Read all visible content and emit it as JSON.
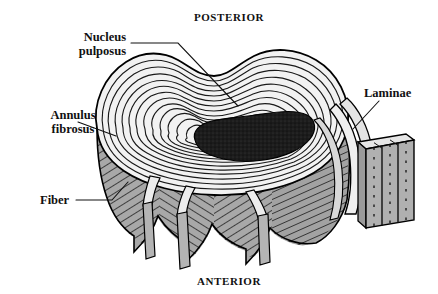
{
  "figure": {
    "background_color": "#ffffff",
    "orientation_labels": {
      "top": "POSTERIOR",
      "bottom": "ANTERIOR"
    },
    "labels": [
      {
        "id": "nucleus-pulposus",
        "lines": [
          "Nucleus",
          "pulposus"
        ],
        "line1": "Nucleus",
        "line2": "pulposus",
        "align": "center",
        "x": 72,
        "y": 32
      },
      {
        "id": "annulus-fibrosus",
        "lines": [
          "Annulus",
          "fibrosus"
        ],
        "line1": "Annulus",
        "line2": "fibrosus",
        "align": "center",
        "x": 14,
        "y": 110
      },
      {
        "id": "fiber",
        "lines": [
          "Fiber"
        ],
        "line1": "Fiber",
        "align": "left",
        "x": 40,
        "y": 199
      },
      {
        "id": "laminae",
        "lines": [
          "Laminae"
        ],
        "line1": "Laminae",
        "align": "left",
        "x": 363,
        "y": 94
      }
    ],
    "colors": {
      "ink": "#111111",
      "outline": "#000000",
      "nucleus_fill": "#1c1c1c",
      "annulus_gray": "#a8a8a8",
      "lamella_light": "#f2f2f2",
      "strip_gray": "#b4b4b4",
      "block_gray": "#b0b0b0",
      "background": "#ffffff"
    },
    "structure": {
      "lamellae_ring_count": 13,
      "peeled_strip_count": 3,
      "laminae_block_slab_count": 3,
      "hatch_panels": 4
    }
  }
}
